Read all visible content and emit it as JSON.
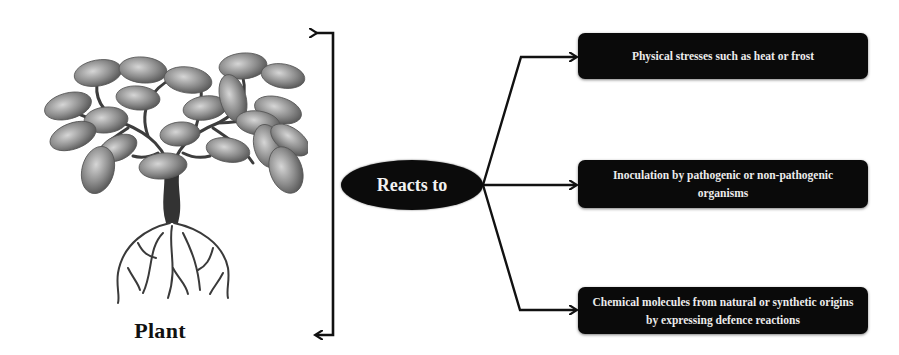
{
  "diagram": {
    "subject": {
      "label": "Plant",
      "icon": "tree-with-roots-icon"
    },
    "hub": {
      "label": "Reacts to"
    },
    "stimuli": [
      {
        "label": "Physical stresses such as heat or frost"
      },
      {
        "label": "Inoculation by pathogenic or non-pathogenic organisms"
      },
      {
        "label": "Chemical molecules from natural or synthetic origins by expressing defence reactions"
      }
    ],
    "colors": {
      "box_fill": "#0a0a0a",
      "box_text": "#ececec",
      "line": "#111111",
      "foliage": "#8a8a8a",
      "trunk": "#3a3a3a"
    }
  }
}
